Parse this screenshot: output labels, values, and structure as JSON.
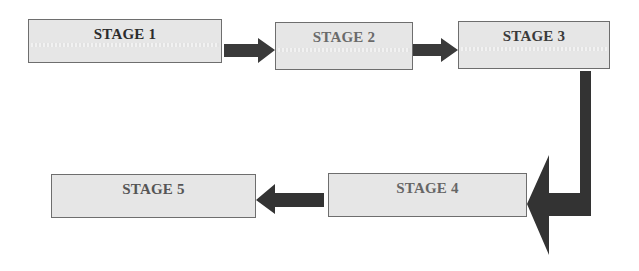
{
  "diagram": {
    "type": "process-flow",
    "stages": [
      {
        "id": "s1",
        "label": "STAGE 1"
      },
      {
        "id": "s2",
        "label": "STAGE 2"
      },
      {
        "id": "s3",
        "label": "STAGE 3"
      },
      {
        "id": "s4",
        "label": "STAGE 4"
      },
      {
        "id": "s5",
        "label": "STAGE 5"
      }
    ],
    "connections": [
      {
        "from": "STAGE 1",
        "to": "STAGE 2",
        "direction": "right"
      },
      {
        "from": "STAGE 2",
        "to": "STAGE 3",
        "direction": "right"
      },
      {
        "from": "STAGE 3",
        "to": "STAGE 4",
        "direction": "down-then-left"
      },
      {
        "from": "STAGE 4",
        "to": "STAGE 5",
        "direction": "left"
      }
    ],
    "colors": {
      "box_fill": "#e6e6e6",
      "box_border": "#6e6e6e",
      "arrow": "#3a3a3a"
    }
  }
}
